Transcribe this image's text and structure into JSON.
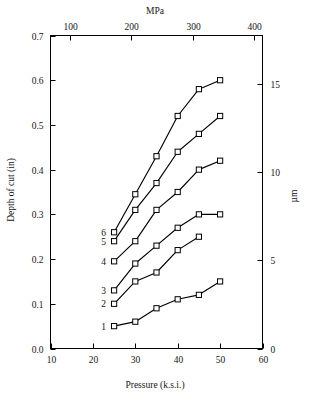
{
  "chart_data": {
    "type": "line",
    "title": "",
    "xlabel": "Pressure (k.s.i.)",
    "ylabel": "Depth of cut (in)",
    "x2label": "MPa",
    "y2label": "µm",
    "xlim": [
      10,
      60
    ],
    "ylim": [
      0.0,
      0.7
    ],
    "x2lim": [
      68.95,
      413.7
    ],
    "y2lim": [
      0.0,
      17.78
    ],
    "xticks": [
      10,
      20,
      30,
      40,
      50,
      60
    ],
    "xtick_labels": [
      "10",
      "20",
      "30",
      "40",
      "50",
      "60"
    ],
    "yticks": [
      0.0,
      0.1,
      0.2,
      0.3,
      0.4,
      0.5,
      0.6,
      0.7
    ],
    "ytick_labels": [
      "0.0",
      "0.1",
      "0.2",
      "0.3",
      "0.4",
      "0.5",
      "0.6",
      "0.7"
    ],
    "x2ticks": [
      100,
      200,
      300,
      400
    ],
    "x2tick_labels": [
      "100",
      "200",
      "300",
      "400"
    ],
    "y2ticks": [
      0,
      5,
      10,
      15
    ],
    "y2tick_labels": [
      "0",
      "5",
      "10",
      "15"
    ],
    "grid": false,
    "legend_position": "inline-left-of-first-point",
    "marker": "open-square",
    "series": [
      {
        "name": "1",
        "label": "1",
        "x": [
          25,
          30,
          35,
          40,
          45,
          50
        ],
        "values": [
          0.05,
          0.06,
          0.09,
          0.11,
          0.12,
          0.15
        ]
      },
      {
        "name": "2",
        "label": "2",
        "x": [
          25,
          30,
          35,
          40,
          45
        ],
        "values": [
          0.1,
          0.15,
          0.17,
          0.22,
          0.25
        ]
      },
      {
        "name": "3",
        "label": "3",
        "x": [
          25,
          30,
          35,
          40,
          45,
          50
        ],
        "values": [
          0.13,
          0.19,
          0.23,
          0.27,
          0.3,
          0.3
        ]
      },
      {
        "name": "4",
        "label": "4",
        "x": [
          25,
          30,
          35,
          40,
          45,
          50
        ],
        "values": [
          0.195,
          0.24,
          0.31,
          0.35,
          0.4,
          0.42
        ]
      },
      {
        "name": "5",
        "label": "5",
        "x": [
          25,
          30,
          35,
          40,
          45,
          50
        ],
        "values": [
          0.24,
          0.31,
          0.37,
          0.44,
          0.48,
          0.52
        ]
      },
      {
        "name": "6",
        "label": "6",
        "x": [
          25,
          30,
          35,
          40,
          45,
          50
        ],
        "values": [
          0.26,
          0.345,
          0.43,
          0.52,
          0.58,
          0.6
        ]
      }
    ]
  },
  "colors": {
    "axis": "#000000",
    "line": "#000000",
    "marker_fill": "#ffffff",
    "background": "#ffffff"
  }
}
